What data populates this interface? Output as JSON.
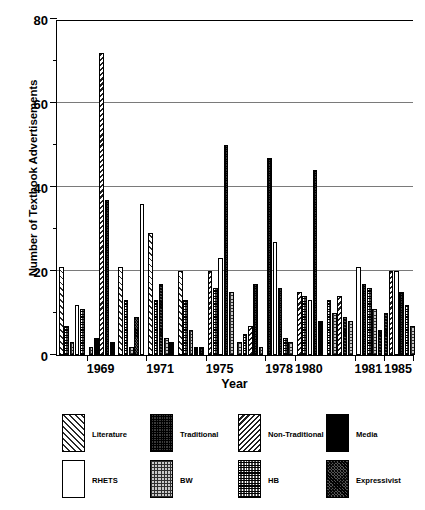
{
  "chart_data": {
    "type": "bar",
    "title": "",
    "xlabel": "Year",
    "ylabel": "Number of Textbook Advertisements",
    "ylim": [
      0,
      80
    ],
    "yticks": [
      0,
      20,
      40,
      60,
      80
    ],
    "yticks_minor": [
      10,
      30,
      50,
      70
    ],
    "grid": "horizontal",
    "legend_position": "below-plot",
    "categories": [
      "Literature",
      "Traditional",
      "Non-Traditional",
      "Media",
      "RHETS",
      "BW",
      "HB",
      "Expressivist"
    ],
    "xtick_labels": [
      "1969",
      "1971",
      "1975",
      "1978",
      "1980",
      "1981",
      "1985",
      "1990"
    ],
    "groups": [
      {
        "label": "",
        "bars": [
          {
            "series": "Literature",
            "value": 21
          },
          {
            "series": "HB",
            "value": 7
          },
          {
            "series": "BW",
            "value": 3
          },
          {
            "series": "RHETS",
            "value": 12
          },
          {
            "series": "HB",
            "value": 11
          }
        ]
      },
      {
        "label": "1969",
        "bars": [
          {
            "series": "BW",
            "value": 2
          },
          {
            "series": "Media",
            "value": 4
          },
          {
            "series": "Non-Traditional",
            "value": 72
          },
          {
            "series": "Traditional",
            "value": 37
          },
          {
            "series": "Media",
            "value": 3
          }
        ]
      },
      {
        "label": "",
        "bars": [
          {
            "series": "Literature",
            "value": 21
          },
          {
            "series": "HB",
            "value": 13
          },
          {
            "series": "BW",
            "value": 2
          },
          {
            "series": "Expressivist",
            "value": 9
          },
          {
            "series": "RHETS",
            "value": 36
          }
        ]
      },
      {
        "label": "1971",
        "bars": [
          {
            "series": "Literature",
            "value": 29
          },
          {
            "series": "HB",
            "value": 13
          },
          {
            "series": "Expressivist",
            "value": 17
          },
          {
            "series": "BW",
            "value": 4
          },
          {
            "series": "Media",
            "value": 3
          }
        ]
      },
      {
        "label": "",
        "bars": [
          {
            "series": "Literature",
            "value": 20
          },
          {
            "series": "HB",
            "value": 13
          },
          {
            "series": "BW",
            "value": 6
          },
          {
            "series": "Media",
            "value": 2
          },
          {
            "series": "Traditional",
            "value": 2
          }
        ]
      },
      {
        "label": "1975",
        "bars": [
          {
            "series": "Non-Traditional",
            "value": 20
          },
          {
            "series": "HB",
            "value": 16
          },
          {
            "series": "RHETS",
            "value": 23
          },
          {
            "series": "Traditional",
            "value": 50
          },
          {
            "series": "BW",
            "value": 15
          }
        ]
      },
      {
        "label": "",
        "bars": [
          {
            "series": "BW",
            "value": 3
          },
          {
            "series": "HB",
            "value": 5
          },
          {
            "series": "Non-Traditional",
            "value": 7
          },
          {
            "series": "Traditional",
            "value": 17
          },
          {
            "series": "BW",
            "value": 2
          }
        ]
      },
      {
        "label": "1978",
        "bars": [
          {
            "series": "Traditional",
            "value": 47
          },
          {
            "series": "RHETS",
            "value": 27
          },
          {
            "series": "Traditional",
            "value": 16
          },
          {
            "series": "HB",
            "value": 4
          },
          {
            "series": "BW",
            "value": 3
          }
        ]
      },
      {
        "label": "1980",
        "bars": [
          {
            "series": "Non-Traditional",
            "value": 15
          },
          {
            "series": "HB",
            "value": 14
          },
          {
            "series": "RHETS",
            "value": 13
          },
          {
            "series": "Traditional",
            "value": 44
          },
          {
            "series": "Media",
            "value": 8
          }
        ]
      },
      {
        "label": "",
        "bars": [
          {
            "series": "HB",
            "value": 13
          },
          {
            "series": "BW",
            "value": 10
          },
          {
            "series": "Non-Traditional",
            "value": 14
          },
          {
            "series": "Expressivist",
            "value": 9
          },
          {
            "series": "BW",
            "value": 8
          }
        ]
      },
      {
        "label": "1981",
        "bars": [
          {
            "series": "RHETS",
            "value": 21
          },
          {
            "series": "Traditional",
            "value": 17
          },
          {
            "series": "HB",
            "value": 16
          },
          {
            "series": "BW",
            "value": 11
          },
          {
            "series": "Expressivist",
            "value": 6
          }
        ]
      },
      {
        "label": "1985",
        "bars": [
          {
            "series": "Expressivist",
            "value": 10
          },
          {
            "series": "Non-Traditional",
            "value": 20
          },
          {
            "series": "RHETS",
            "value": 20
          },
          {
            "series": "Traditional",
            "value": 15
          },
          {
            "series": "HB",
            "value": 12
          },
          {
            "series": "BW",
            "value": 7
          }
        ]
      }
    ]
  },
  "legend": {
    "row1": [
      {
        "label": "Literature",
        "pattern": "p-literature"
      },
      {
        "label": "Traditional",
        "pattern": "p-traditional"
      },
      {
        "label": "Non-Traditional",
        "pattern": "p-nontraditional"
      },
      {
        "label": "Media",
        "pattern": "p-media"
      }
    ],
    "row2": [
      {
        "label": "RHETS",
        "pattern": "p-rhets"
      },
      {
        "label": "BW",
        "pattern": "p-bw"
      },
      {
        "label": "HB",
        "pattern": "p-hb"
      },
      {
        "label": "Expressivist",
        "pattern": "p-expressivist"
      }
    ]
  }
}
